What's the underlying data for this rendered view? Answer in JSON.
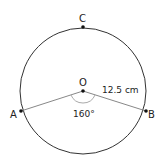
{
  "diagram": {
    "points": {
      "A": "A",
      "B": "B",
      "C": "C",
      "O": "O"
    },
    "radius_label": "12.5 cm",
    "angle_label": "160°",
    "colors": {
      "circle": "#333333",
      "radii": "#888888",
      "angle_arc": "#aaaaaa",
      "points": "#111111"
    }
  }
}
